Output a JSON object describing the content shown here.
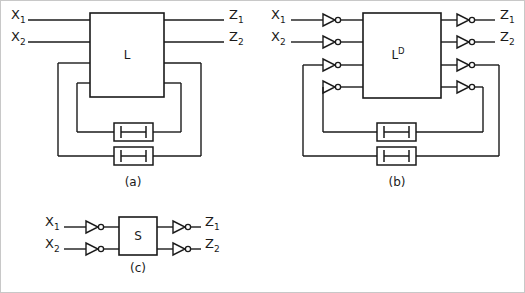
{
  "figure": {
    "background_color": "#ffffff",
    "line_color": "#1a1a1a",
    "panels": [
      {
        "id": "a",
        "caption": "(a)",
        "box_label": "L",
        "box_superscript": "",
        "inputs": [
          {
            "name": "X1",
            "base": "X",
            "sub": "1"
          },
          {
            "name": "X2",
            "base": "X",
            "sub": "2"
          }
        ],
        "outputs": [
          {
            "name": "Z1",
            "base": "Z",
            "sub": "1"
          },
          {
            "name": "Z2",
            "base": "Z",
            "sub": "2"
          }
        ],
        "feedback_count": 2,
        "delay_count": 2,
        "inverters": 0,
        "delay_symbol": "delay-element"
      },
      {
        "id": "b",
        "caption": "(b)",
        "box_label": "L",
        "box_superscript": "D",
        "inputs": [
          {
            "name": "X1",
            "base": "X",
            "sub": "1"
          },
          {
            "name": "X2",
            "base": "X",
            "sub": "2"
          }
        ],
        "outputs": [
          {
            "name": "Z1",
            "base": "Z",
            "sub": "1"
          },
          {
            "name": "Z2",
            "base": "Z",
            "sub": "2"
          }
        ],
        "feedback_count": 2,
        "delay_count": 2,
        "inverters": 8,
        "delay_symbol": "delay-element"
      },
      {
        "id": "c",
        "caption": "(c)",
        "box_label": "S",
        "box_superscript": "",
        "inputs": [
          {
            "name": "X1",
            "base": "X",
            "sub": "1"
          },
          {
            "name": "X2",
            "base": "X",
            "sub": "2"
          }
        ],
        "outputs": [
          {
            "name": "Z1",
            "base": "Z",
            "sub": "1"
          },
          {
            "name": "Z2",
            "base": "Z",
            "sub": "2"
          }
        ],
        "feedback_count": 0,
        "delay_count": 0,
        "inverters": 4,
        "delay_symbol": ""
      }
    ]
  }
}
